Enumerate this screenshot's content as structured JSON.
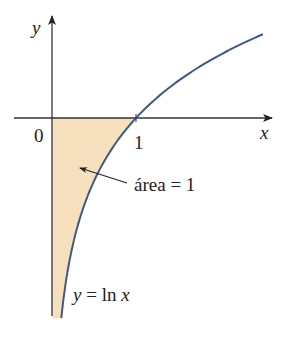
{
  "figure": {
    "function_label": "y = ln x",
    "function_label_parts": {
      "y": "y",
      "eq": " = ",
      "ln": "ln ",
      "x": "x"
    },
    "area_label": "área = 1",
    "axis_labels": {
      "x": "x",
      "y": "y"
    },
    "tick_labels": {
      "origin": "0",
      "one": "1"
    },
    "colors": {
      "curve": "#3d5a8c",
      "fill": "#f6e0bd",
      "axis": "#333333",
      "text": "#222222"
    }
  },
  "chart_data": {
    "type": "line",
    "title": "",
    "function": "y = ln x",
    "xlabel": "x",
    "ylabel": "y",
    "x_ticks": [
      0,
      1
    ],
    "xlim": [
      0,
      2.5
    ],
    "ylim": [
      -2.2,
      0.95
    ],
    "shaded_region": {
      "between": [
        "y-axis",
        "x-axis",
        "y = ln x"
      ],
      "x_range": [
        0,
        1
      ],
      "label": "área = 1",
      "area": 1
    },
    "annotations": [
      "área = 1",
      "y = ln x"
    ]
  }
}
